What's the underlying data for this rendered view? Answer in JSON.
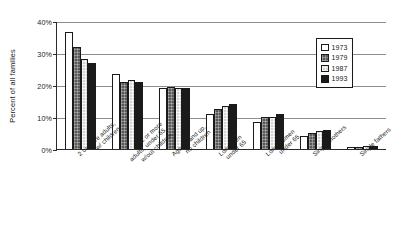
{
  "chart_data": {
    "type": "bar",
    "title": "",
    "xlabel": "",
    "ylabel": "Percent of all families",
    "ylim": [
      0,
      40
    ],
    "ytick_labels": [
      "0%",
      "10%",
      "20%",
      "30%",
      "40%"
    ],
    "ytick_values": [
      0,
      10,
      20,
      30,
      40
    ],
    "grid": true,
    "legend_position": "top-right",
    "categories": [
      "2 or more adults, w/ children",
      "2 or more adults, under 65, w/out children",
      "Age 65 and up, no children",
      "Lone men under 65",
      "Lone women under 65",
      "Single mothers",
      "Single fathers"
    ],
    "category_lines": [
      [
        "2 or more adults,",
        "w/ children"
      ],
      [
        "2 or more",
        "adults, under 65,",
        "w/out children"
      ],
      [
        "Age 65 and up,",
        "no children"
      ],
      [
        "Lone men",
        "under 65"
      ],
      [
        "Lone women",
        "under 65"
      ],
      [
        "Single mothers"
      ],
      [
        "Single fathers"
      ]
    ],
    "series": [
      {
        "name": "1973",
        "color": "#ffffff",
        "values": [
          36.5,
          23.5,
          19.0,
          11.0,
          8.5,
          4.0,
          0.6
        ]
      },
      {
        "name": "1979",
        "color": "#595959",
        "values": [
          32.0,
          21.0,
          19.5,
          12.5,
          10.0,
          5.0,
          0.7
        ]
      },
      {
        "name": "1987",
        "color": "#d4d4d4",
        "values": [
          28.0,
          21.5,
          19.0,
          13.5,
          10.0,
          5.5,
          0.9
        ]
      },
      {
        "name": "1993",
        "color": "#1a1a1a",
        "values": [
          26.8,
          21.0,
          19.0,
          14.0,
          11.0,
          6.0,
          1.0
        ]
      }
    ]
  }
}
